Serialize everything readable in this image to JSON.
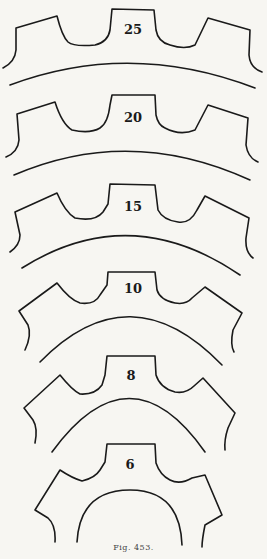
{
  "figure": {
    "caption": "Fig. 453.",
    "stroke_color": "#1a1a1a",
    "background": "#f7f6f2",
    "gears": [
      {
        "teeth": "25",
        "label_x": 133,
        "label_y": 29
      },
      {
        "teeth": "20",
        "label_x": 133,
        "label_y": 118
      },
      {
        "teeth": "15",
        "label_x": 133,
        "label_y": 200
      },
      {
        "teeth": "10",
        "label_x": 133,
        "label_y": 282
      },
      {
        "teeth": "8",
        "label_x": 131,
        "label_y": 370
      },
      {
        "teeth": "6",
        "label_x": 130,
        "label_y": 461
      }
    ]
  }
}
